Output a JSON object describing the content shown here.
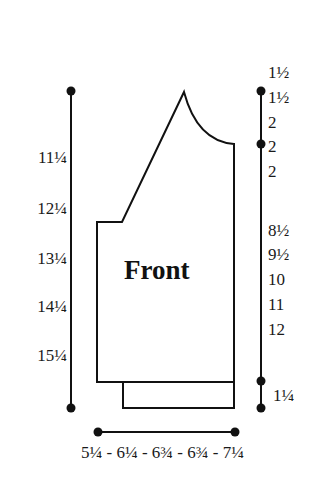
{
  "diagram": {
    "title": "Front",
    "type": "knitting-schematic",
    "colors": {
      "line": "#111111",
      "background": "#ffffff",
      "text": "#1a1a1a"
    }
  },
  "left_measurements": {
    "description": "total length sizes",
    "labels": [
      "11¼",
      "12¼",
      "13¼",
      "14¼",
      "15¼"
    ]
  },
  "right_measurements": {
    "top_group": [
      "1½",
      "1½",
      "2",
      "2",
      "2"
    ],
    "middle_group": [
      "8½",
      "9½",
      "10",
      "11",
      "12"
    ],
    "bottom_group": [
      "1¼"
    ]
  },
  "bottom_measurement": {
    "label": "5¼ - 6¼ - 6¾ - 6¾ - 7¼"
  }
}
